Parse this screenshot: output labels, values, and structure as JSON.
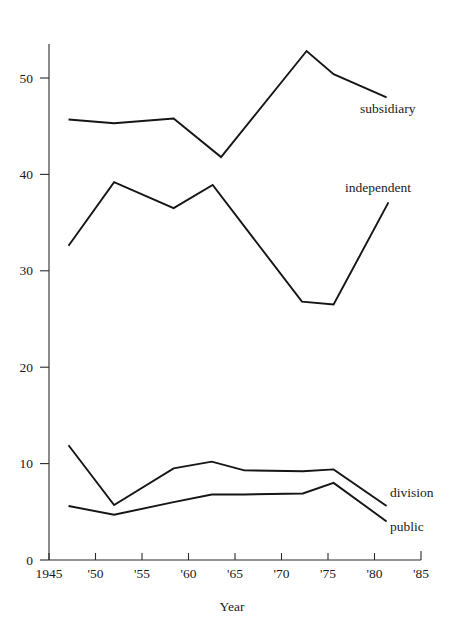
{
  "chart_data": {
    "type": "line",
    "title": "",
    "xlabel": "Year",
    "ylabel": "",
    "xlim": [
      1945,
      1985
    ],
    "ylim": [
      0,
      55
    ],
    "grid": false,
    "legend_position": "inline-right-end-labels",
    "x_ticks": [
      "1945",
      "'50",
      "'55",
      "'60",
      "'65",
      "'70",
      "'75",
      "'80",
      "'85"
    ],
    "x_tick_values": [
      1945,
      1950,
      1955,
      1960,
      1965,
      1970,
      1975,
      1980,
      1985
    ],
    "y_ticks": [
      "0",
      "10",
      "20",
      "30",
      "40",
      "50"
    ],
    "y_tick_values": [
      0,
      10,
      20,
      30,
      40,
      50
    ],
    "series": [
      {
        "name": "subsidiary",
        "label": "subsidiary",
        "x": [
          1947.1,
          1952.0,
          1958.4,
          1963.5,
          1972.7,
          1975.6,
          1981.3
        ],
        "values": [
          45.7,
          45.3,
          45.8,
          41.8,
          52.8,
          50.4,
          48.0
        ]
      },
      {
        "name": "independent",
        "label": "independent",
        "x": [
          1947.1,
          1952.0,
          1958.4,
          1962.6,
          1972.2,
          1975.6,
          1981.5
        ],
        "values": [
          32.6,
          39.2,
          36.5,
          38.9,
          26.8,
          26.5,
          37.1
        ]
      },
      {
        "name": "division",
        "label": "division",
        "x": [
          1947.1,
          1952.0,
          1958.4,
          1962.5,
          1966.0,
          1972.3,
          1975.6,
          1981.3
        ],
        "values": [
          11.9,
          5.7,
          9.5,
          10.2,
          9.3,
          9.2,
          9.4,
          5.6
        ]
      },
      {
        "name": "public",
        "label": "public",
        "x": [
          1947.1,
          1952.0,
          1958.4,
          1962.5,
          1966.0,
          1972.3,
          1975.6,
          1981.3
        ],
        "values": [
          5.6,
          4.7,
          6.0,
          6.8,
          6.8,
          6.9,
          8.0,
          4.0
        ]
      }
    ],
    "series_end_labels": [
      {
        "name": "subsidiary",
        "text": "subsidiary",
        "x": 360,
        "y": 113
      },
      {
        "name": "independent",
        "text": "independent",
        "x": 345,
        "y": 192
      },
      {
        "name": "division",
        "text": "division",
        "x": 390,
        "y": 497
      },
      {
        "name": "public",
        "text": "public",
        "x": 390,
        "y": 531
      }
    ]
  },
  "axes": {
    "x_axis_title": "Year"
  }
}
